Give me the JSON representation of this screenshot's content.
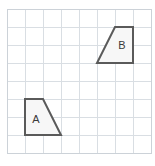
{
  "figure": {
    "type": "geometry-grid-diagram",
    "width": 155,
    "height": 166,
    "background_color": "#ffffff"
  },
  "grid": {
    "name": "square-grid",
    "origin_x": 7,
    "origin_y": 9,
    "cell_size": 18,
    "columns": 8,
    "rows": 8,
    "line_color": "#d9dee3",
    "border_color": "#ccd2d8",
    "show_border": true,
    "show_lines": true,
    "x_positions": [
      7,
      25,
      43,
      61,
      79,
      97,
      115,
      133,
      151
    ],
    "y_positions": [
      9,
      27,
      45,
      63,
      81,
      99,
      117,
      135,
      153
    ]
  },
  "shapes": [
    {
      "id": "shape-b",
      "label": "B",
      "kind": "trapezoid",
      "fill_color": "#f7f7f7",
      "stroke_color": "#5a5a5a",
      "stroke_width": 2,
      "points": "115,27 133,27 133,63 97,63",
      "vertices": [
        {
          "x": 115,
          "y": 27
        },
        {
          "x": 133,
          "y": 27
        },
        {
          "x": 133,
          "y": 63
        },
        {
          "x": 97,
          "y": 63
        }
      ],
      "grid_vertices": [
        {
          "col": 6,
          "row": 1
        },
        {
          "col": 7,
          "row": 1
        },
        {
          "col": 7,
          "row": 3
        },
        {
          "col": 5,
          "row": 3
        }
      ],
      "label_x": 122,
      "label_y": 46,
      "label_color": "#3a3a3a"
    },
    {
      "id": "shape-a",
      "label": "A",
      "kind": "trapezoid",
      "fill_color": "#f7f7f7",
      "stroke_color": "#5a5a5a",
      "stroke_width": 2,
      "points": "25,99 43,99 61,135 25,135",
      "vertices": [
        {
          "x": 25,
          "y": 99
        },
        {
          "x": 43,
          "y": 99
        },
        {
          "x": 61,
          "y": 135
        },
        {
          "x": 25,
          "y": 135
        }
      ],
      "grid_vertices": [
        {
          "col": 1,
          "row": 5
        },
        {
          "col": 2,
          "row": 5
        },
        {
          "col": 3,
          "row": 7
        },
        {
          "col": 1,
          "row": 7
        }
      ],
      "label_x": 36,
      "label_y": 120,
      "label_color": "#3a3a3a"
    }
  ]
}
